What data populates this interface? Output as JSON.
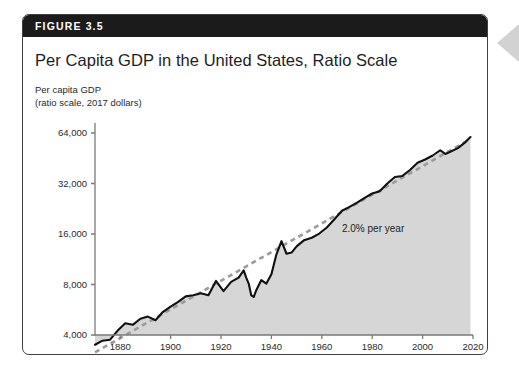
{
  "figure": {
    "number_label": "FIGURE 3.5",
    "title": "Per Capita GDP in the United States, Ratio Scale",
    "y_axis_caption_line1": "Per capita GDP",
    "y_axis_caption_line2": "(ratio scale, 2017 dollars)"
  },
  "colors": {
    "header_band": "#1b1b1b",
    "card_border": "#3d4043",
    "card_background": "#ffffff",
    "data_line": "#111111",
    "trend_line": "#9b9b9b",
    "area_fill": "#d6d6d6",
    "axis": "#7a7a7a",
    "text": "#1d1d1d",
    "edge_arrow": "#d2d2d2"
  },
  "chart_data": {
    "type": "line",
    "title": "Per Capita GDP in the United States, Ratio Scale",
    "subtitle": "Per capita GDP (ratio scale, 2017 dollars)",
    "xlabel": "Year",
    "ylabel": "Per capita GDP (ratio scale, 2017 dollars)",
    "yscale": "log",
    "grid": false,
    "legend": "none",
    "xlim": [
      1870,
      2020
    ],
    "ylim": [
      3000,
      72000
    ],
    "xticks": [
      1880,
      1900,
      1920,
      1940,
      1960,
      1980,
      2000,
      2020
    ],
    "xtick_labels": [
      "1880",
      "1900",
      "1920",
      "1940",
      "1960",
      "1980",
      "2000",
      "2020"
    ],
    "yticks": [
      4000,
      8000,
      16000,
      32000,
      64000
    ],
    "ytick_labels": [
      "4,000",
      "8,000",
      "16,000",
      "32,000",
      "64,000"
    ],
    "annotations": [
      {
        "text": "2.0% per year",
        "x": 1968,
        "y": 16500
      }
    ],
    "series": [
      {
        "name": "Per capita GDP",
        "style": "solid",
        "color": "#111111",
        "filled_below": true,
        "x": [
          1870,
          1873,
          1876,
          1879,
          1882,
          1885,
          1888,
          1891,
          1894,
          1897,
          1900,
          1903,
          1906,
          1909,
          1912,
          1915,
          1918,
          1921,
          1924,
          1927,
          1929,
          1930,
          1931,
          1932,
          1933,
          1934,
          1936,
          1938,
          1940,
          1942,
          1944,
          1946,
          1948,
          1950,
          1953,
          1956,
          1959,
          1962,
          1965,
          1968,
          1971,
          1974,
          1977,
          1980,
          1983,
          1986,
          1989,
          1992,
          1995,
          1998,
          2001,
          2004,
          2007,
          2009,
          2011,
          2014,
          2017,
          2019
        ],
        "y": [
          3500,
          3700,
          3750,
          4250,
          4700,
          4600,
          5000,
          5150,
          4900,
          5500,
          5900,
          6300,
          6800,
          6900,
          7100,
          6900,
          8400,
          7300,
          8300,
          8800,
          9700,
          8800,
          8100,
          6900,
          6750,
          7400,
          8500,
          8100,
          9200,
          12100,
          14500,
          12200,
          12400,
          13500,
          14700,
          15200,
          16100,
          17500,
          19600,
          22000,
          23200,
          24600,
          26300,
          27900,
          28800,
          32000,
          35000,
          35500,
          38500,
          42500,
          44500,
          47000,
          50500,
          48000,
          49500,
          52000,
          56500,
          60500
        ]
      },
      {
        "name": "2.0% per year trend",
        "style": "dashed",
        "color": "#9b9b9b",
        "filled_below": false,
        "x": [
          1870,
          2019
        ],
        "y": [
          3150,
          59000
        ]
      }
    ]
  }
}
